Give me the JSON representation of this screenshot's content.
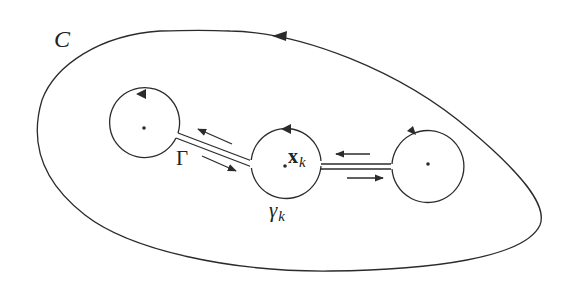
{
  "diagram": {
    "type": "contour-deformation",
    "colors": {
      "stroke": "#2b2b2b",
      "background": "#ffffff"
    },
    "outer_contour": {
      "label": "C",
      "orientation": "counterclockwise"
    },
    "circles": [
      {
        "id": "left",
        "center": [
          144,
          128
        ],
        "radius": 35,
        "orientation": "counterclockwise"
      },
      {
        "id": "middle",
        "center": [
          286,
          163
        ],
        "radius": 35,
        "orientation": "counterclockwise",
        "point_label": "x",
        "point_subscript": "k",
        "circle_label": "γ",
        "circle_subscript": "k"
      },
      {
        "id": "right",
        "center": [
          427,
          164
        ],
        "radius": 36,
        "orientation": "counterclockwise"
      }
    ],
    "channels": [
      {
        "id": "left-middle",
        "label": "Γ",
        "arrows": [
          "toward left circle (upper)",
          "toward middle circle (lower)"
        ]
      },
      {
        "id": "middle-right",
        "arrows": [
          "toward middle circle (upper)",
          "toward right circle (lower)"
        ]
      }
    ]
  },
  "labels": {
    "outer": "C",
    "cut": "Γ",
    "point_main": "x",
    "point_sub": "k",
    "circle_main": "γ",
    "circle_sub": "k"
  }
}
